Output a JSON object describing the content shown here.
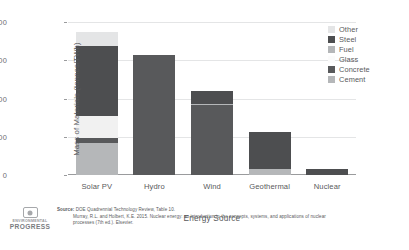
{
  "chart_data": {
    "type": "bar",
    "stacked": true,
    "title": "",
    "xlabel": "Energy Source",
    "ylabel": "Mass of Materials (tonnes/TWh)",
    "categories": [
      "Solar PV",
      "Hydro",
      "Wind",
      "Geothermal",
      "Nuclear"
    ],
    "ylim": [
      0,
      18000
    ],
    "yticks": [
      0,
      4500,
      9000,
      13500,
      18000
    ],
    "ytick_labels": [
      "0",
      "4500",
      "9000",
      "13500",
      "18000"
    ],
    "grid": "horizontal",
    "legend_position": "top-right",
    "series": [
      {
        "name": "Cement",
        "color": "#b5b7b9",
        "values": [
          3800,
          0,
          0,
          700,
          0
        ]
      },
      {
        "name": "Concrete",
        "color": "#58595b",
        "values": [
          500,
          14100,
          8200,
          0,
          0
        ]
      },
      {
        "name": "Glass",
        "color": "#f1f1f1",
        "values": [
          2600,
          0,
          0,
          0,
          0
        ]
      },
      {
        "name": "Fuel",
        "color": "#b5b7b9",
        "values": [
          0,
          0,
          150,
          0,
          0
        ]
      },
      {
        "name": "Steel",
        "color": "#4d4e50",
        "values": [
          8300,
          0,
          1550,
          4400,
          760
        ]
      },
      {
        "name": "Other",
        "color": "#e4e5e6",
        "values": [
          1600,
          0,
          0,
          0,
          0
        ]
      }
    ],
    "totals": [
      16800,
      14100,
      9900,
      5100,
      760
    ]
  },
  "legend": {
    "items": [
      {
        "label": "Other",
        "color": "#e4e5e6"
      },
      {
        "label": "Steel",
        "color": "#4d4e50"
      },
      {
        "label": "Fuel",
        "color": "#b5b7b9"
      },
      {
        "label": "Glass",
        "color": "#fbfbfb"
      },
      {
        "label": "Concrete",
        "color": "#58595b"
      },
      {
        "label": "Cement",
        "color": "#b5b7b9"
      }
    ]
  },
  "footer": {
    "logo_line1": "ENVIRONMENTAL",
    "logo_line2": "PROGRESS",
    "source_label": "Source:",
    "source_line1": "DOE Quadrennial Technology Review, Table 10.",
    "source_line2": "Murray, R.L. and Holbert, K.E. 2015. Nuclear energy: an introduction to the concepts, systems, and applications of nuclear",
    "source_line3": "processes (7th ed.). Elsevier."
  },
  "colors": {
    "grid": "#e4e5e6",
    "axis": "#9a9b9d",
    "text": "#58595b",
    "background": "#ffffff"
  }
}
